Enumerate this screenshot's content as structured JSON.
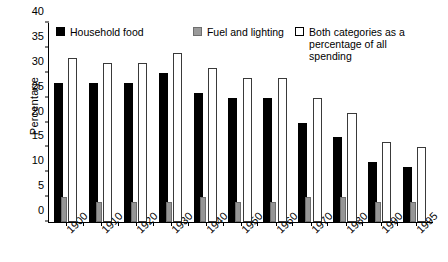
{
  "chart_data": {
    "type": "bar",
    "title": "",
    "xlabel": "",
    "ylabel": "Percentage",
    "ylim": [
      0,
      40
    ],
    "yticks": [
      0,
      5,
      10,
      15,
      20,
      25,
      30,
      35,
      40
    ],
    "grid": false,
    "legend_position": "top-inside",
    "categories": [
      "1900",
      "1910",
      "1920",
      "1930",
      "1940",
      "1950",
      "1960",
      "1970",
      "1980",
      "1990",
      "1995"
    ],
    "series": [
      {
        "name": "Household food",
        "color": "#000000",
        "values": [
          28,
          28,
          28,
          30,
          26,
          25,
          25,
          20,
          17,
          12,
          11
        ]
      },
      {
        "name": "Fuel and lighting",
        "color": "#969696",
        "values": [
          5,
          4,
          4,
          4,
          5,
          4,
          4,
          5,
          5,
          4,
          4
        ]
      },
      {
        "name": "Both categories as a percentage of all spending",
        "color": "#ffffff",
        "values": [
          33,
          32,
          32,
          34,
          31,
          29,
          29,
          25,
          22,
          16,
          15
        ]
      }
    ]
  },
  "legend": {
    "items": [
      {
        "label": "Household food",
        "swatch": "food"
      },
      {
        "label": "Fuel and lighting",
        "swatch": "fuel"
      },
      {
        "label": "Both categories as a percentage of all spending",
        "swatch": "both"
      }
    ]
  },
  "axes": {
    "y_title": "Percentage"
  }
}
